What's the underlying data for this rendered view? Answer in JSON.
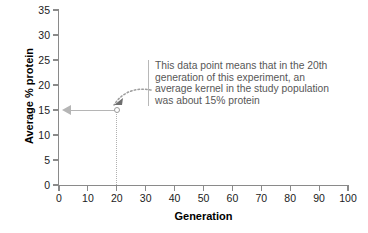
{
  "chart_data": {
    "type": "scatter",
    "title": "",
    "xlabel": "Generation",
    "ylabel": "Average % protein",
    "x": [
      20
    ],
    "values": [
      15
    ],
    "points": [
      {
        "x": 20,
        "y": 15
      }
    ],
    "xlim": [
      0,
      100
    ],
    "ylim": [
      0,
      35
    ],
    "xticks": [
      0,
      10,
      20,
      30,
      40,
      50,
      60,
      70,
      80,
      90,
      100
    ],
    "yticks": [
      0,
      5,
      10,
      15,
      20,
      25,
      30,
      35
    ],
    "xtick_labels": [
      "0",
      "10",
      "20",
      "30",
      "40",
      "50",
      "60",
      "70",
      "80",
      "90",
      "100"
    ],
    "ytick_labels": [
      "0",
      "5",
      "10",
      "15",
      "20",
      "25",
      "30",
      "35"
    ],
    "grid": false,
    "legend": null,
    "annotations": [
      {
        "name": "data-point-callout",
        "lines": [
          "This data point means that in the 20th",
          "generation of this experiment, an",
          "average kernel in the study population",
          "was about 15% protein"
        ],
        "target": {
          "x": 20,
          "y": 15
        }
      },
      {
        "name": "y-value-indicator-arrow",
        "description": "gray arrow from data point left to y-axis at 15"
      },
      {
        "name": "x-value-dropline",
        "description": "dotted vertical line from data point down to x-axis at 20"
      }
    ]
  },
  "colors": {
    "axis": "#8a8a8a",
    "tick_label": "#1b1b1b",
    "axis_title": "#000000",
    "annotation_text": "#575757",
    "annotation_rule": "#b8b8b8",
    "marker_stroke": "#9a9a9a",
    "guide": "#b5b5b5",
    "dotted_guide": "#b0b0b0",
    "background": "#ffffff"
  }
}
